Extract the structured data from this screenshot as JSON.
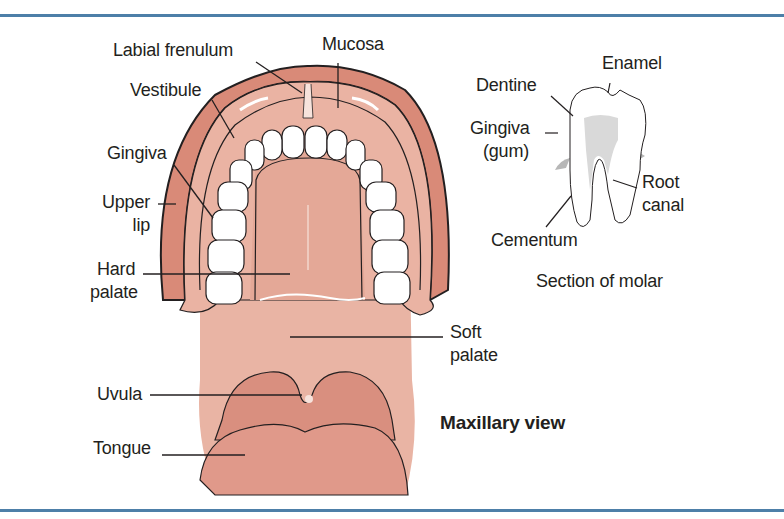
{
  "figure": {
    "title": "Maxillary view",
    "inset_title": "Section of molar",
    "colors": {
      "rule": "#4d7fa8",
      "lip": "#d98a78",
      "mucosa": "#eab3a3",
      "palate": "#e4a897",
      "tooth": "#ffffff",
      "outline": "#231f20",
      "gum_grey": "#b7b7b7",
      "pulp_grey": "#d9d9d9"
    }
  },
  "labels": {
    "labial_frenulum": "Labial frenulum",
    "mucosa": "Mucosa",
    "vestibule": "Vestibule",
    "gingiva": "Gingiva",
    "upper_lip_1": "Upper",
    "upper_lip_2": "lip",
    "hard_palate_1": "Hard",
    "hard_palate_2": "palate",
    "soft_palate_1": "Soft",
    "soft_palate_2": "palate",
    "uvula": "Uvula",
    "tongue": "Tongue"
  },
  "molar_labels": {
    "enamel": "Enamel",
    "dentine": "Dentine",
    "gingiva_1": "Gingiva",
    "gingiva_2": "(gum)",
    "root_1": "Root",
    "root_2": "canal",
    "cementum": "Cementum"
  }
}
